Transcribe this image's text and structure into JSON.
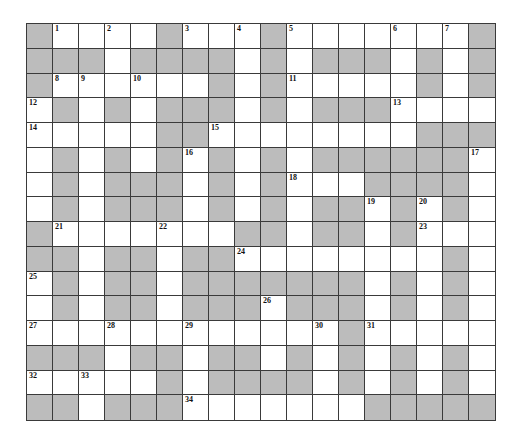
{
  "puzzle": {
    "rows": 16,
    "cols": 18,
    "colors": {
      "block": "#bcbcbc",
      "open": "#ffffff",
      "line": "#3a3a3a",
      "number": "#111111"
    },
    "grid": [
      "#..... .#...#.......#",
      "placeholder"
    ],
    "layout": [
      "#.....#...#.......#",
      ""
    ]
  },
  "grid_rows": [
    "#....#...#.......#",
    "###.####.#.###.#.#",
    "#......#.#.....#.#",
    ".#.#.###.#.###....",
    ".....##........###",
    ".#.#.#.#.#.######.",
    ".#.###.#.#...####.",
    ".#.###.#.#.##.#.#.",
    "#.......##.##.#...",
    "##.##.##........#.",
    ".#.##.#######.#.#.",
    ".#.##.###.###.#.#.",
    "............#.....",
    "###.##.##.#.#.#.#.",
    ".....#.####.#.#.#.",
    "##.###.......#####"
  ],
  "numbers": [
    {
      "n": "1",
      "r": 0,
      "c": 1
    },
    {
      "n": "2",
      "r": 0,
      "c": 3
    },
    {
      "n": "3",
      "r": 0,
      "c": 6
    },
    {
      "n": "4",
      "r": 0,
      "c": 8
    },
    {
      "n": "5",
      "r": 0,
      "c": 10
    },
    {
      "n": "6",
      "r": 0,
      "c": 14
    },
    {
      "n": "7",
      "r": 0,
      "c": 16
    },
    {
      "n": "8",
      "r": 2,
      "c": 1
    },
    {
      "n": "9",
      "r": 2,
      "c": 2
    },
    {
      "n": "10",
      "r": 2,
      "c": 4
    },
    {
      "n": "11",
      "r": 2,
      "c": 10
    },
    {
      "n": "12",
      "r": 3,
      "c": 0
    },
    {
      "n": "13",
      "r": 3,
      "c": 14
    },
    {
      "n": "14",
      "r": 4,
      "c": 0
    },
    {
      "n": "15",
      "r": 4,
      "c": 7
    },
    {
      "n": "16",
      "r": 5,
      "c": 6
    },
    {
      "n": "17",
      "r": 5,
      "c": 17
    },
    {
      "n": "18",
      "r": 6,
      "c": 10
    },
    {
      "n": "19",
      "r": 7,
      "c": 13
    },
    {
      "n": "20",
      "r": 7,
      "c": 15
    },
    {
      "n": "21",
      "r": 8,
      "c": 1
    },
    {
      "n": "22",
      "r": 8,
      "c": 5
    },
    {
      "n": "23",
      "r": 8,
      "c": 15
    },
    {
      "n": "24",
      "r": 9,
      "c": 8
    },
    {
      "n": "25",
      "r": 10,
      "c": 0
    },
    {
      "n": "26",
      "r": 11,
      "c": 9
    },
    {
      "n": "27",
      "r": 12,
      "c": 0
    },
    {
      "n": "28",
      "r": 12,
      "c": 3
    },
    {
      "n": "29",
      "r": 12,
      "c": 6
    },
    {
      "n": "30",
      "r": 12,
      "c": 11
    },
    {
      "n": "31",
      "r": 12,
      "c": 13
    },
    {
      "n": "32",
      "r": 14,
      "c": 0
    },
    {
      "n": "33",
      "r": 14,
      "c": 2
    },
    {
      "n": "34",
      "r": 15,
      "c": 6
    }
  ]
}
